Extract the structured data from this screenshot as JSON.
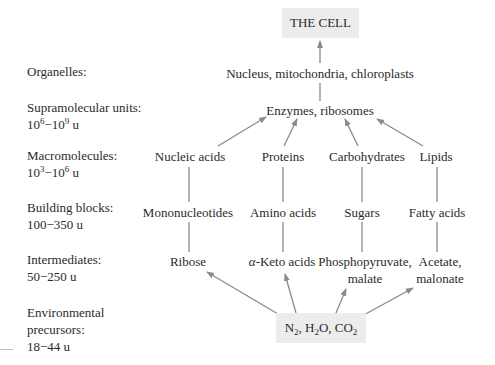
{
  "title_box": {
    "label": "THE CELL"
  },
  "levels": [
    {
      "id": "organelles",
      "label": "Organelles:",
      "range": ""
    },
    {
      "id": "supramolecular",
      "label": "Supramolecular units:",
      "range_base1": "10",
      "range_exp1": "6",
      "range_sep": "−",
      "range_base2": "10",
      "range_exp2": "9",
      "range_unit": " u"
    },
    {
      "id": "macromolecules",
      "label": "Macromolecules:",
      "range_base1": "10",
      "range_exp1": "3",
      "range_sep": "−",
      "range_base2": "10",
      "range_exp2": "6",
      "range_unit": " u"
    },
    {
      "id": "building-blocks",
      "label": "Building blocks:",
      "range": "100−350 u"
    },
    {
      "id": "intermediates",
      "label": "Intermediates:",
      "range": "50−250 u"
    },
    {
      "id": "environmental",
      "label_line1": "Environmental",
      "label_line2": "precursors:",
      "range": "18−44 u"
    }
  ],
  "nodes": {
    "organelles": "Nucleus, mitochondria, chloroplasts",
    "supramolecular": "Enzymes, ribosomes",
    "macromolecules": [
      "Nucleic acids",
      "Proteins",
      "Carbohydrates",
      "Lipids"
    ],
    "building_blocks": [
      "Mononucleotides",
      "Amino acids",
      "Sugars",
      "Fatty acids"
    ],
    "intermediates": [
      {
        "line1": "Ribose",
        "line2": ""
      },
      {
        "line1_greek": "α",
        "line1": "-Keto acids",
        "line2": ""
      },
      {
        "line1": "Phosphopyruvate,",
        "line2": "malate"
      },
      {
        "line1": "Acetate,",
        "line2": "malonate"
      }
    ]
  },
  "precursors_box": {
    "parts": [
      {
        "base": "N",
        "sub": "2",
        "after": ", "
      },
      {
        "base": "H",
        "sub": "2",
        "after": "O, "
      },
      {
        "base": "CO",
        "sub": "2",
        "after": ""
      }
    ]
  },
  "colors": {
    "arrow": "#8a8a8a",
    "box_fill": "#ececec",
    "text": "#2a2a2a"
  }
}
